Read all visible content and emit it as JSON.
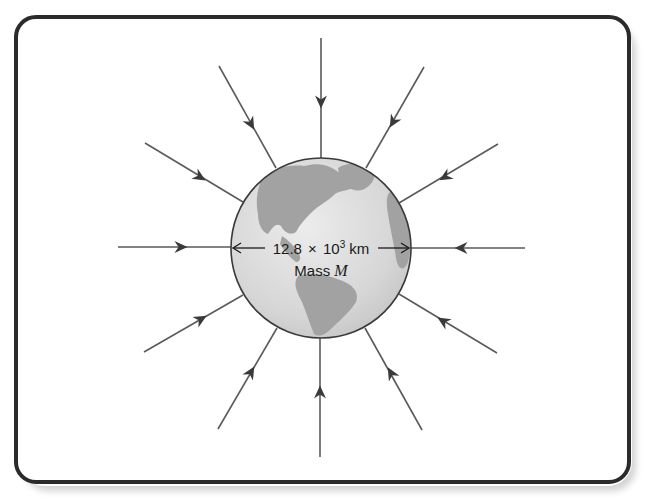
{
  "figure": {
    "globe": {
      "center": [
        321,
        248
      ],
      "radius": 90,
      "ocean_color": "#dcdcdc",
      "land_color": "#9e9e9e",
      "outline_color": "#3a3a3a"
    },
    "diameter_label": {
      "value": "12.8",
      "times": "×",
      "base": "10",
      "exponent": "3",
      "unit": "km"
    },
    "mass_label": {
      "prefix": "Mass ",
      "symbol": "M"
    },
    "frame": {
      "border_color": "#2b2b2b"
    },
    "field_lines": [
      {
        "name": "top",
        "from": [
          321,
          38
        ],
        "to": [
          321,
          158
        ],
        "arrow_at": [
          321,
          102
        ]
      },
      {
        "name": "upper-left",
        "from": [
          219,
          66
        ],
        "to": [
          276,
          168
        ],
        "arrow_at": [
          251,
          124
        ]
      },
      {
        "name": "upper-right",
        "from": [
          424,
          67
        ],
        "to": [
          366,
          168
        ],
        "arrow_at": [
          393,
          122
        ]
      },
      {
        "name": "left-upper",
        "from": [
          145,
          143
        ],
        "to": [
          243,
          202
        ],
        "arrow_at": [
          200,
          177
        ]
      },
      {
        "name": "right-upper",
        "from": [
          498,
          144
        ],
        "to": [
          399,
          203
        ],
        "arrow_at": [
          445,
          177
        ]
      },
      {
        "name": "left",
        "from": [
          118,
          247
        ],
        "to": [
          231,
          247
        ],
        "arrow_at": [
          181,
          247
        ]
      },
      {
        "name": "right",
        "from": [
          525,
          248
        ],
        "to": [
          411,
          248
        ],
        "arrow_at": [
          461,
          248
        ]
      },
      {
        "name": "left-lower",
        "from": [
          144,
          352
        ],
        "to": [
          243,
          295
        ],
        "arrow_at": [
          201,
          319
        ]
      },
      {
        "name": "right-lower",
        "from": [
          497,
          353
        ],
        "to": [
          399,
          294
        ],
        "arrow_at": [
          443,
          321
        ]
      },
      {
        "name": "lower-left",
        "from": [
          218,
          429
        ],
        "to": [
          277,
          328
        ],
        "arrow_at": [
          251,
          372
        ]
      },
      {
        "name": "bottom",
        "from": [
          320,
          457
        ],
        "to": [
          320,
          338
        ],
        "arrow_at": [
          320,
          392
        ]
      },
      {
        "name": "lower-right",
        "from": [
          422,
          430
        ],
        "to": [
          365,
          328
        ],
        "arrow_at": [
          391,
          373
        ]
      }
    ]
  }
}
